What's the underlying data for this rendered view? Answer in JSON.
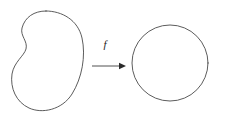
{
  "canvas": {
    "width": 225,
    "height": 116,
    "background_color": "#ffffff",
    "stroke_color": "#4a4a4a",
    "label_color": "#1c1c1c"
  },
  "diagram": {
    "type": "function-mapping-diagram",
    "domain_shape": {
      "name": "blob",
      "description": "kidney-shaped closed curve",
      "bounds": {
        "x": 8,
        "y": 10,
        "width": 76,
        "height": 102
      },
      "path": "M 46 11 C 62 11, 78 20, 82 38 C 86 56, 82 78, 72 94 C 62 110, 42 114, 29 108 C 16 102, 10 88, 12 74 C 14 62, 24 56, 26 49 C 28 41, 20 36, 22 28 C 25 17, 34 11, 46 11 Z"
    },
    "codomain_shape": {
      "name": "circle",
      "description": "circle",
      "center_x": 170,
      "center_y": 63,
      "radius": 38
    },
    "arrow": {
      "label": "f",
      "label_x": 105,
      "label_y": 48,
      "start_x": 92,
      "end_x": 126,
      "y": 66,
      "head_size": 5
    }
  }
}
